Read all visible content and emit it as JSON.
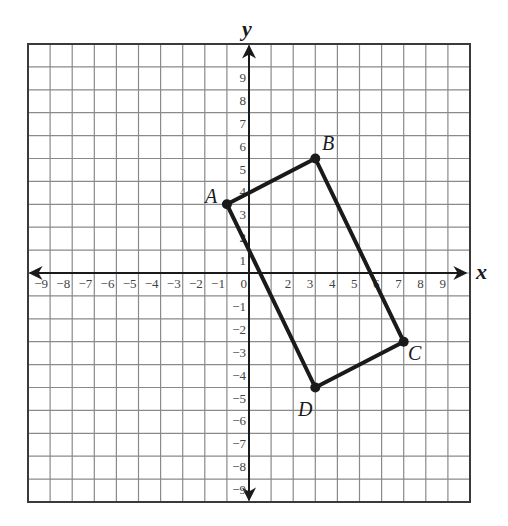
{
  "chart_data": {
    "type": "scatter",
    "title": "",
    "xlabel": "x",
    "ylabel": "y",
    "xlim": [
      -10,
      10
    ],
    "ylim": [
      -10,
      10
    ],
    "grid": true,
    "x_ticks": [
      -9,
      -8,
      -7,
      -6,
      -5,
      -4,
      -3,
      -2,
      -1,
      0,
      2,
      3,
      4,
      5,
      6,
      7,
      8,
      9
    ],
    "y_ticks": [
      9,
      8,
      7,
      6,
      5,
      4,
      3,
      2,
      1,
      -1,
      -2,
      -3,
      -4,
      -5,
      -6,
      -7,
      -8,
      -9
    ],
    "x_tick_labels": [
      "−9",
      "−8",
      "−7",
      "−6",
      "−5",
      "−4",
      "−3",
      "−2",
      "−1",
      "0",
      "2",
      "3",
      "4",
      "5",
      "6",
      "7",
      "8",
      "9"
    ],
    "y_tick_labels": [
      "9",
      "8",
      "7",
      "6",
      "5",
      "4",
      "3",
      "2",
      "1",
      "−1",
      "−2",
      "−3",
      "−4",
      "−5",
      "−6",
      "−7",
      "−8",
      "−9"
    ],
    "polygon": {
      "name": "ABCD",
      "closed": true,
      "vertices": [
        {
          "label": "A",
          "x": -1,
          "y": 3
        },
        {
          "label": "B",
          "x": 3,
          "y": 5
        },
        {
          "label": "C",
          "x": 7,
          "y": -3
        },
        {
          "label": "D",
          "x": 3,
          "y": -5
        }
      ]
    }
  },
  "labels": {
    "x_axis": "x",
    "y_axis": "y",
    "A": "A",
    "B": "B",
    "C": "C",
    "D": "D"
  },
  "colors": {
    "grid": "#8a8a8a",
    "axis": "#1a1a1a",
    "shape": "#1a1a1a",
    "background": "#ffffff"
  }
}
